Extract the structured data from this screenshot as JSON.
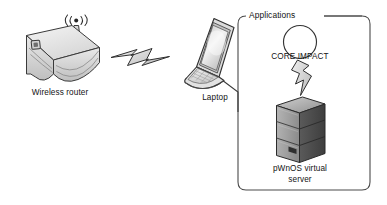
{
  "diagram": {
    "background_color": "#ffffff",
    "stroke_color": "#2b2b2b",
    "nodes": {
      "router": {
        "label": "Wireless router",
        "icon": "wireless-router-icon",
        "position": {
          "x": 62,
          "y": 55
        }
      },
      "laptop": {
        "label": "Laptop",
        "icon": "laptop-icon",
        "position": {
          "x": 215,
          "y": 55
        }
      },
      "core_impact": {
        "label": "CORE IMPACT",
        "icon": "application-circle-icon",
        "position": {
          "x": 300,
          "y": 42
        }
      },
      "server": {
        "label": "pWnOS virtual server",
        "label_line1": "pWnOS virtual",
        "label_line2": "server",
        "icon": "server-tower-icon",
        "position": {
          "x": 300,
          "y": 130
        }
      }
    },
    "container": {
      "label": "Applications",
      "shape": "rounded-rectangle",
      "bounds": {
        "x": 238,
        "y": 16,
        "width": 132,
        "height": 174
      }
    },
    "links": [
      {
        "name": "wireless-link",
        "icon": "lightning-bolt-horizontal-icon",
        "from": "router",
        "to": "laptop",
        "style": "wireless"
      },
      {
        "name": "exploit-link",
        "icon": "lightning-bolt-vertical-icon",
        "from": "core_impact",
        "to": "server",
        "style": "wireless"
      },
      {
        "name": "laptop-to-applications-link",
        "from": "laptop",
        "to": "container",
        "style": "solid"
      }
    ]
  }
}
